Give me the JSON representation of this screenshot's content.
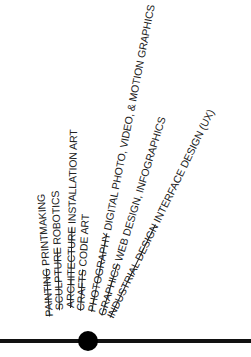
{
  "diagram": {
    "type": "radial-fan",
    "baseline_color": "#111111",
    "node_color": "#000000",
    "labels": [
      {
        "old": "PAINTING",
        "new": "PRINTMAKING"
      },
      {
        "old": "SCULPTURE",
        "new": "ROBOTICS"
      },
      {
        "old": "ARCHITECTURE",
        "new": "INSTALLATION ART"
      },
      {
        "old": "CRAFTS",
        "new": "CODE ART"
      },
      {
        "old": "PHOTOGRAPHY",
        "new": "DIGITAL PHOTO, VIDEO, & MOTION GRAPHICS"
      },
      {
        "old": "GRAPHICS",
        "new": "WEB DESIGN, INFOGRAPHICS"
      },
      {
        "old": "INDUSTRIAL DESIGN",
        "new": "INTERFACE DESIGN (UX)"
      }
    ]
  }
}
